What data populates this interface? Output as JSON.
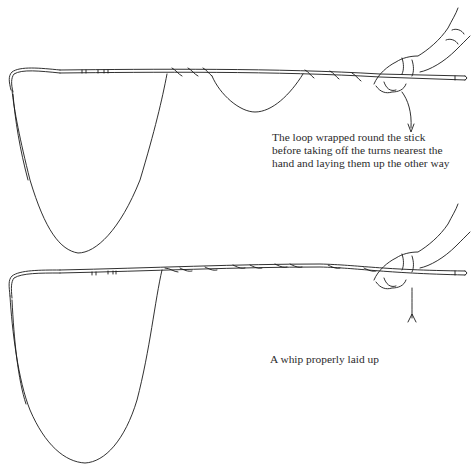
{
  "figure": {
    "panels": [
      {
        "id": "top",
        "subject": "whip-with-loop-wrapped",
        "caption_lines": [
          "The loop wrapped round the stick",
          "before taking off the turns nearest the",
          "hand and laying them up the other way"
        ]
      },
      {
        "id": "bottom",
        "subject": "whip-properly-laid-up",
        "caption_lines": [
          "A whip properly laid up"
        ]
      }
    ],
    "colors": {
      "line": "#1a1a1a",
      "text": "#2b2b2b",
      "background": "#ffffff"
    }
  }
}
